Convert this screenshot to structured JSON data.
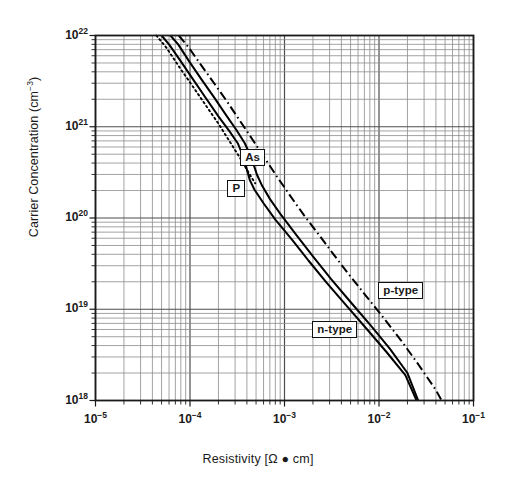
{
  "chart_data": {
    "type": "line",
    "title": "",
    "xlabel": "Resistivity [Ω ● cm]",
    "ylabel": "Carrier Concentration (cm−3)",
    "xscale": "log",
    "yscale": "log",
    "xlim": [
      1e-05,
      0.1
    ],
    "ylim": [
      1e+18,
      1e+22
    ],
    "grid": true,
    "legend_position": "inline-annotations",
    "xticks": [
      "10−5",
      "10−4",
      "10−3",
      "10−2",
      "10−1"
    ],
    "xtick_values": [
      1e-05,
      0.0001,
      0.001,
      0.01,
      0.1
    ],
    "yticks": [
      "10¹⁸",
      "10¹⁹",
      "10²⁰",
      "10²¹",
      "10²²"
    ],
    "ytick_values": [
      1e+18,
      1e+19,
      1e+20,
      1e+21,
      1e+22
    ],
    "annotations": [
      {
        "text": "As",
        "x": 0.00046,
        "y": 4.6e+20,
        "style": "boxed"
      },
      {
        "text": "P",
        "x": 0.00031,
        "y": 2.1e+20,
        "style": "boxed"
      },
      {
        "text": "p-type",
        "x": 0.017,
        "y": 1.6e+19,
        "style": "boxed"
      },
      {
        "text": "n-type",
        "x": 0.0034,
        "y": 6e+18,
        "style": "boxed"
      }
    ],
    "series": [
      {
        "name": "P",
        "label": "P",
        "carrier_type": "n-type",
        "dopant": "Phosphorus",
        "linestyle": "solid",
        "color": "#000000",
        "points": [
          [
            5e-05,
            1e+22
          ],
          [
            6e-05,
            8e+21
          ],
          [
            8e-05,
            5.2e+21
          ],
          [
            0.00011,
            3.2e+21
          ],
          [
            0.00015,
            2e+21
          ],
          [
            0.0002,
            1.3e+21
          ],
          [
            0.00026,
            9e+20
          ],
          [
            0.00032,
            6.6e+20
          ],
          [
            0.00037,
            4.6e+20
          ],
          [
            0.0004,
            3.4e+20
          ],
          [
            0.00043,
            2.6e+20
          ],
          [
            0.00048,
            2.05e+20
          ],
          [
            0.0006,
            1.45e+20
          ],
          [
            0.0008,
            9.6e+19
          ],
          [
            0.0012,
            5.8e+19
          ],
          [
            0.0018,
            3.4e+19
          ],
          [
            0.0028,
            1.95e+19
          ],
          [
            0.0045,
            1.1e+19
          ],
          [
            0.0075,
            6e+18
          ],
          [
            0.012,
            3.4e+18
          ],
          [
            0.019,
            1.9e+18
          ],
          [
            0.025,
            1e+18
          ]
        ]
      },
      {
        "name": "As",
        "label": "As",
        "carrier_type": "n-type",
        "dopant": "Arsenic",
        "linestyle": "solid",
        "color": "#000000",
        "points": [
          [
            6.2e-05,
            1e+22
          ],
          [
            7.5e-05,
            8e+21
          ],
          [
            9.8e-05,
            5.2e+21
          ],
          [
            0.000135,
            3.2e+21
          ],
          [
            0.00018,
            2.1e+21
          ],
          [
            0.00024,
            1.35e+21
          ],
          [
            0.00031,
            9.2e+20
          ],
          [
            0.00038,
            6.6e+20
          ],
          [
            0.00043,
            5e+20
          ],
          [
            0.00047,
            3.9e+20
          ],
          [
            0.00051,
            3e+20
          ],
          [
            0.00058,
            2.25e+20
          ],
          [
            0.0007,
            1.62e+20
          ],
          [
            0.00092,
            1.08e+20
          ],
          [
            0.00135,
            6.4e+19
          ],
          [
            0.002,
            3.8e+19
          ],
          [
            0.0031,
            2.15e+19
          ],
          [
            0.005,
            1.2e+19
          ],
          [
            0.0082,
            6.6e+18
          ],
          [
            0.013,
            3.7e+18
          ],
          [
            0.02,
            2e+18
          ],
          [
            0.026,
            1e+18
          ]
        ]
      },
      {
        "name": "p-type",
        "label": "p-type",
        "carrier_type": "p-type",
        "dopant": "Boron",
        "linestyle": "dashdot",
        "color": "#000000",
        "points": [
          [
            7.6e-05,
            1e+22
          ],
          [
            9.5e-05,
            7.6e+21
          ],
          [
            0.00013,
            4.8e+21
          ],
          [
            0.00018,
            3e+21
          ],
          [
            0.00025,
            1.85e+21
          ],
          [
            0.00034,
            1.15e+21
          ],
          [
            0.00046,
            7.2e+20
          ],
          [
            0.00062,
            4.5e+20
          ],
          [
            0.00084,
            2.8e+20
          ],
          [
            0.00115,
            1.75e+20
          ],
          [
            0.0016,
            1.08e+20
          ],
          [
            0.0023,
            6.6e+19
          ],
          [
            0.0033,
            4e+19
          ],
          [
            0.0048,
            2.4e+19
          ],
          [
            0.0072,
            1.42e+19
          ],
          [
            0.011,
            8.2e+18
          ],
          [
            0.017,
            4.6e+18
          ],
          [
            0.026,
            2.5e+18
          ],
          [
            0.04,
            1.3e+18
          ],
          [
            0.046,
            1e+18
          ]
        ]
      },
      {
        "name": "p-type-extension",
        "label": "",
        "carrier_type": "p-type",
        "dopant": "Boron",
        "linestyle": "dotted",
        "color": "#000000",
        "points": [
          [
            4.4e-05,
            1e+22
          ],
          [
            5.6e-05,
            7.4e+21
          ],
          [
            7.6e-05,
            4.6e+21
          ],
          [
            0.000105,
            2.85e+21
          ],
          [
            0.000145,
            1.75e+21
          ],
          [
            0.0002,
            1.08e+21
          ],
          [
            0.00027,
            6.6e+20
          ],
          [
            0.00036,
            4.1e+20
          ],
          [
            0.00042,
            3.1e+20
          ],
          [
            0.00049,
            2.4e+20
          ]
        ]
      }
    ]
  },
  "figure": {
    "frame_color": "#1a1a1a",
    "grid_major_color": "#4d4d4d",
    "grid_minor_color": "#8c8c8c",
    "background": "#ffffff"
  }
}
